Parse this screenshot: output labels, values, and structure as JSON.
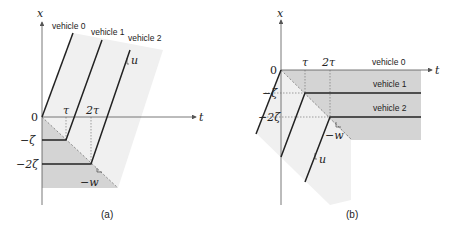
{
  "panels": [
    {
      "id": "a",
      "caption": "(a)",
      "x_axis_label": "t",
      "y_axis_label": "x",
      "origin_label": "0",
      "t_ticks": [
        "τ",
        "2τ"
      ],
      "x_ticks": [
        "−ζ",
        "−2ζ"
      ],
      "vehicles": [
        "vehicle 0",
        "vehicle 1",
        "vehicle 2"
      ],
      "slope_labels": {
        "free_flow": "u",
        "congested": "−w"
      }
    },
    {
      "id": "b",
      "caption": "(b)",
      "x_axis_label": "t",
      "y_axis_label": "x",
      "origin_label": "0",
      "t_ticks": [
        "τ",
        "2τ"
      ],
      "x_ticks": [
        "−ζ",
        "−2ζ"
      ],
      "vehicles": [
        "vehicle 0",
        "vehicle 1",
        "vehicle 2"
      ],
      "slope_labels": {
        "free_flow": "u",
        "congested": "−w"
      }
    }
  ],
  "colors": {
    "axis": "#555555",
    "trajectory": "#222222",
    "dark_shade": "#cfcfcf",
    "light_shade": "#eeeeee",
    "dashed": "#666666"
  }
}
